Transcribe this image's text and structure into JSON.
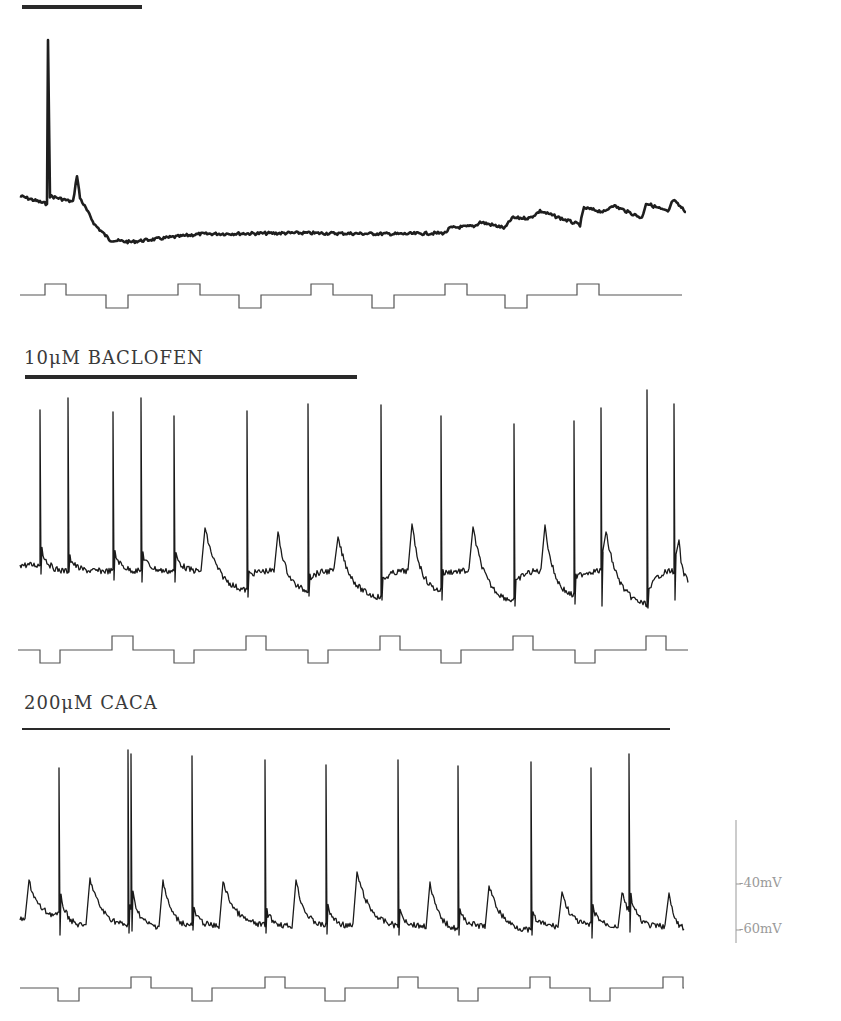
{
  "chart_data": {
    "type": "line",
    "title": "",
    "panels": [
      {
        "id": "top",
        "label": "",
        "drug_bar": {
          "x1": 22,
          "x2": 142,
          "y": 7,
          "thick": 4
        },
        "trace": {
          "baseline_y": 200,
          "x_start": 20,
          "x_end": 686,
          "segments": [
            {
              "x": 20,
              "y": 196
            },
            {
              "x": 47,
              "y": 204
            },
            {
              "x": 48,
              "y": 40,
              "spike": true
            },
            {
              "x": 50,
              "y": 196
            },
            {
              "x": 73,
              "y": 202
            },
            {
              "x": 77,
              "y": 175
            },
            {
              "x": 80,
              "y": 198
            },
            {
              "x": 95,
              "y": 225
            },
            {
              "x": 110,
              "y": 240
            },
            {
              "x": 130,
              "y": 242
            },
            {
              "x": 200,
              "y": 234
            },
            {
              "x": 300,
              "y": 233
            },
            {
              "x": 400,
              "y": 234
            },
            {
              "x": 445,
              "y": 233
            },
            {
              "x": 450,
              "y": 228
            },
            {
              "x": 475,
              "y": 226
            },
            {
              "x": 480,
              "y": 222
            },
            {
              "x": 505,
              "y": 228
            },
            {
              "x": 512,
              "y": 218
            },
            {
              "x": 530,
              "y": 218
            },
            {
              "x": 540,
              "y": 211
            },
            {
              "x": 580,
              "y": 225
            },
            {
              "x": 584,
              "y": 208
            },
            {
              "x": 605,
              "y": 212
            },
            {
              "x": 612,
              "y": 205
            },
            {
              "x": 642,
              "y": 218
            },
            {
              "x": 646,
              "y": 203
            },
            {
              "x": 668,
              "y": 212
            },
            {
              "x": 673,
              "y": 200
            },
            {
              "x": 686,
              "y": 212
            }
          ],
          "stroke_width": 2.6
        },
        "command": {
          "y_base": 295,
          "y_up": 284,
          "y_down": 308,
          "pulses": [
            {
              "type": "up",
              "x1": 45,
              "x2": 66
            },
            {
              "type": "down",
              "x1": 106,
              "x2": 128
            },
            {
              "type": "up",
              "x1": 178,
              "x2": 200
            },
            {
              "type": "down",
              "x1": 239,
              "x2": 261
            },
            {
              "type": "up",
              "x1": 311,
              "x2": 333
            },
            {
              "type": "down",
              "x1": 372,
              "x2": 394
            },
            {
              "type": "up",
              "x1": 445,
              "x2": 467
            },
            {
              "type": "down",
              "x1": 505,
              "x2": 527
            },
            {
              "type": "up",
              "x1": 577,
              "x2": 599
            }
          ],
          "x_start": 20,
          "x_end": 682
        }
      },
      {
        "id": "middle",
        "label": "10μM BACLOFEN",
        "label_pos": {
          "x": 24,
          "y": 347
        },
        "drug_bar": {
          "x1": 25,
          "x2": 357,
          "y": 377,
          "thick": 4
        },
        "trace": {
          "x_start": 20,
          "x_end": 688,
          "base_y": 565,
          "spikes": [
            {
              "x": 40,
              "peak": 410,
              "trough": 574
            },
            {
              "x": 68,
              "peak": 398,
              "trough": 572
            },
            {
              "x": 113,
              "peak": 412,
              "trough": 580
            },
            {
              "x": 141,
              "peak": 398,
              "trough": 582
            },
            {
              "x": 174,
              "peak": 416,
              "trough": 582
            },
            {
              "x": 247,
              "peak": 411,
              "trough": 597
            },
            {
              "x": 308,
              "peak": 404,
              "trough": 596
            },
            {
              "x": 381,
              "peak": 405,
              "trough": 600
            },
            {
              "x": 441,
              "peak": 416,
              "trough": 600
            },
            {
              "x": 514,
              "peak": 424,
              "trough": 606
            },
            {
              "x": 574,
              "peak": 421,
              "trough": 604
            },
            {
              "x": 601,
              "peak": 408,
              "trough": 606
            },
            {
              "x": 647,
              "peak": 390,
              "trough": 608
            },
            {
              "x": 674,
              "peak": 404,
              "trough": 600
            }
          ],
          "epsps": [
            {
              "x": 201,
              "peak": 528,
              "decay_to": 590,
              "until": 245
            },
            {
              "x": 274,
              "peak": 532,
              "decay_to": 590,
              "until": 305
            },
            {
              "x": 334,
              "peak": 537,
              "decay_to": 597,
              "until": 378
            },
            {
              "x": 408,
              "peak": 524,
              "decay_to": 590,
              "until": 438
            },
            {
              "x": 469,
              "peak": 527,
              "decay_to": 600,
              "until": 511
            },
            {
              "x": 541,
              "peak": 525,
              "decay_to": 595,
              "until": 572
            },
            {
              "x": 602,
              "peak": 532,
              "decay_to": 604,
              "until": 645
            },
            {
              "x": 675,
              "peak": 540,
              "decay_to": 580,
              "until": 688
            }
          ]
        },
        "command": {
          "y_base": 650,
          "y_up": 636,
          "y_down": 663,
          "pulses": [
            {
              "type": "down",
              "x1": 40,
              "x2": 60
            },
            {
              "type": "up",
              "x1": 112,
              "x2": 133
            },
            {
              "type": "down",
              "x1": 174,
              "x2": 194
            },
            {
              "type": "up",
              "x1": 246,
              "x2": 266
            },
            {
              "type": "down",
              "x1": 308,
              "x2": 328
            },
            {
              "type": "up",
              "x1": 380,
              "x2": 400
            },
            {
              "type": "down",
              "x1": 441,
              "x2": 461
            },
            {
              "type": "up",
              "x1": 513,
              "x2": 533
            },
            {
              "type": "down",
              "x1": 575,
              "x2": 595
            },
            {
              "type": "up",
              "x1": 646,
              "x2": 666
            }
          ],
          "x_start": 18,
          "x_end": 688
        }
      },
      {
        "id": "bottom",
        "label": "200μM CACA",
        "label_pos": {
          "x": 24,
          "y": 692
        },
        "drug_bar": {
          "x1": 22,
          "x2": 670,
          "y": 729,
          "thick": 2
        },
        "trace": {
          "x_start": 20,
          "x_end": 684,
          "base_y": 920,
          "spikes": [
            {
              "x": 59,
              "peak": 768,
              "trough": 935
            },
            {
              "x": 128,
              "peak": 750,
              "trough": 933
            },
            {
              "x": 131,
              "peak": 754,
              "trough": 931
            },
            {
              "x": 192,
              "peak": 756,
              "trough": 930
            },
            {
              "x": 265,
              "peak": 760,
              "trough": 933
            },
            {
              "x": 326,
              "peak": 765,
              "trough": 934
            },
            {
              "x": 398,
              "peak": 760,
              "trough": 935
            },
            {
              "x": 458,
              "peak": 766,
              "trough": 935
            },
            {
              "x": 531,
              "peak": 762,
              "trough": 935
            },
            {
              "x": 591,
              "peak": 768,
              "trough": 938
            },
            {
              "x": 629,
              "peak": 754,
              "trough": 932
            }
          ],
          "epsps": [
            {
              "x": 25,
              "peak": 880,
              "decay_to": 915,
              "until": 55
            },
            {
              "x": 86,
              "peak": 878,
              "decay_to": 925,
              "until": 126
            },
            {
              "x": 159,
              "peak": 880,
              "decay_to": 925,
              "until": 188
            },
            {
              "x": 219,
              "peak": 882,
              "decay_to": 925,
              "until": 262
            },
            {
              "x": 292,
              "peak": 880,
              "decay_to": 925,
              "until": 322
            },
            {
              "x": 353,
              "peak": 872,
              "decay_to": 925,
              "until": 395
            },
            {
              "x": 426,
              "peak": 882,
              "decay_to": 928,
              "until": 455
            },
            {
              "x": 485,
              "peak": 886,
              "decay_to": 930,
              "until": 528
            },
            {
              "x": 558,
              "peak": 892,
              "decay_to": 925,
              "until": 588
            },
            {
              "x": 618,
              "peak": 893,
              "decay_to": 930,
              "until": 655
            },
            {
              "x": 665,
              "peak": 893,
              "decay_to": 928,
              "until": 684
            }
          ]
        },
        "command": {
          "y_base": 988,
          "y_up": 977,
          "y_down": 1001,
          "pulses": [
            {
              "type": "down",
              "x1": 58,
              "x2": 79
            },
            {
              "type": "up",
              "x1": 131,
              "x2": 151
            },
            {
              "type": "down",
              "x1": 192,
              "x2": 212
            },
            {
              "type": "up",
              "x1": 265,
              "x2": 285
            },
            {
              "type": "down",
              "x1": 325,
              "x2": 345
            },
            {
              "type": "up",
              "x1": 398,
              "x2": 418
            },
            {
              "type": "down",
              "x1": 458,
              "x2": 478
            },
            {
              "type": "up",
              "x1": 530,
              "x2": 550
            },
            {
              "type": "down",
              "x1": 590,
              "x2": 610
            },
            {
              "type": "up",
              "x1": 663,
              "x2": 683
            }
          ],
          "x_start": 20,
          "x_end": 684
        }
      }
    ],
    "scale_bar": {
      "x": 736,
      "y_top": 820,
      "y_bottom": 943,
      "ticks": [
        {
          "y": 884,
          "label": "-40mV"
        },
        {
          "y": 930,
          "label": "-60mV"
        }
      ]
    },
    "xlabel": "",
    "ylabel": "membrane potential (mV)",
    "legend": []
  }
}
